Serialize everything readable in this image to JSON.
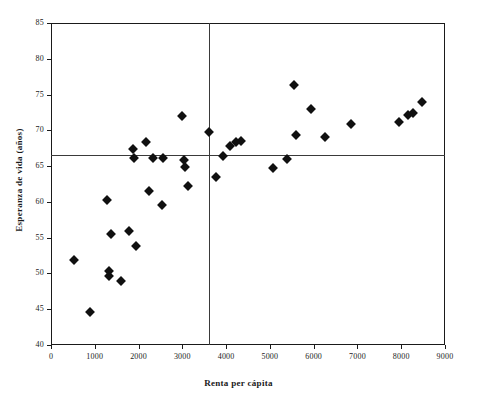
{
  "chart_data": {
    "type": "scatter",
    "title": "",
    "xlabel": "Renta per cápita",
    "ylabel": "Esperanza de vida (años)",
    "xlim": [
      0,
      9000
    ],
    "ylim": [
      40,
      85
    ],
    "xticks": [
      0,
      1000,
      2000,
      3000,
      4000,
      5000,
      6000,
      7000,
      8000,
      9000
    ],
    "yticks": [
      40,
      45,
      50,
      55,
      60,
      65,
      70,
      75,
      80,
      85
    ],
    "grid": false,
    "legend": null,
    "marker": "diamond",
    "marker_color": "#101010",
    "reference_lines": [
      {
        "orientation": "horizontal",
        "value": 66.5,
        "axis": "y",
        "color": "#3a3a3a"
      },
      {
        "orientation": "vertical",
        "value": 3600,
        "axis": "x",
        "color": "#3a3a3a"
      }
    ],
    "points": [
      {
        "x": 530,
        "y": 51.9
      },
      {
        "x": 900,
        "y": 44.6
      },
      {
        "x": 1280,
        "y": 60.3
      },
      {
        "x": 1320,
        "y": 50.4
      },
      {
        "x": 1330,
        "y": 49.6
      },
      {
        "x": 1370,
        "y": 55.5
      },
      {
        "x": 1600,
        "y": 48.9
      },
      {
        "x": 1780,
        "y": 56.0
      },
      {
        "x": 1880,
        "y": 67.4
      },
      {
        "x": 1900,
        "y": 66.2
      },
      {
        "x": 1950,
        "y": 53.8
      },
      {
        "x": 2170,
        "y": 68.4
      },
      {
        "x": 2230,
        "y": 61.5
      },
      {
        "x": 2330,
        "y": 66.1
      },
      {
        "x": 2550,
        "y": 66.1
      },
      {
        "x": 2540,
        "y": 59.5
      },
      {
        "x": 3000,
        "y": 72.0
      },
      {
        "x": 3030,
        "y": 65.9
      },
      {
        "x": 3070,
        "y": 64.9
      },
      {
        "x": 3120,
        "y": 62.2
      },
      {
        "x": 3620,
        "y": 69.8
      },
      {
        "x": 3780,
        "y": 63.5
      },
      {
        "x": 3940,
        "y": 66.4
      },
      {
        "x": 4080,
        "y": 67.8
      },
      {
        "x": 4230,
        "y": 68.4
      },
      {
        "x": 4330,
        "y": 68.5
      },
      {
        "x": 5080,
        "y": 64.7
      },
      {
        "x": 5400,
        "y": 66.0
      },
      {
        "x": 5560,
        "y": 76.3
      },
      {
        "x": 5600,
        "y": 69.4
      },
      {
        "x": 5950,
        "y": 73.0
      },
      {
        "x": 6250,
        "y": 69.1
      },
      {
        "x": 6850,
        "y": 70.9
      },
      {
        "x": 7950,
        "y": 71.2
      },
      {
        "x": 8150,
        "y": 72.2
      },
      {
        "x": 8280,
        "y": 72.4
      },
      {
        "x": 8480,
        "y": 73.9
      }
    ]
  },
  "caption": {
    "text": ""
  }
}
